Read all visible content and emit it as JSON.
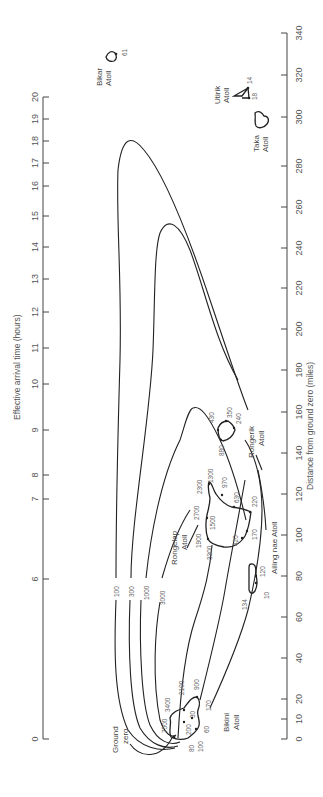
{
  "chart_data": {
    "type": "map",
    "title": "",
    "orientation": "rotated 90deg counter-clockwise",
    "left_axis": {
      "label": "Effective arrival time (hours)",
      "ticks": [
        "0",
        "6",
        "7",
        "8",
        "9",
        "10",
        "11",
        "12",
        "13",
        "14",
        "15",
        "16",
        "17",
        "18",
        "19",
        "20"
      ],
      "scale": "non-linear"
    },
    "right_axis": {
      "label": "Distance from ground zero (miles)",
      "ticks": [
        "0",
        "10",
        "20",
        "40",
        "60",
        "80",
        "100",
        "120",
        "140",
        "160",
        "180",
        "200",
        "220",
        "240",
        "260",
        "280",
        "300",
        "320",
        "340"
      ],
      "range": [
        0,
        340
      ]
    },
    "contours": [
      {
        "label": "100",
        "max_distance_miles": 290
      },
      {
        "label": "300",
        "max_distance_miles": 222
      },
      {
        "label": "1000",
        "max_distance_miles": 160
      },
      {
        "label": "3000",
        "max_distance_miles": 105
      }
    ],
    "inner_contour_labels": [
      "7500",
      "3400",
      "2100",
      "900",
      "170"
    ],
    "atolls": [
      {
        "name": "Bikini Atoll",
        "distance_miles": 5,
        "readings": [
          "7500",
          "3400",
          "2100",
          "900",
          "200",
          "30",
          "80",
          "100",
          "60",
          "170"
        ]
      },
      {
        "name": "Ailinginae Atoll",
        "distance_miles": 80,
        "readings": [
          "134",
          "120",
          "10"
        ]
      },
      {
        "name": "Rongelap Atoll",
        "distance_miles": 110,
        "readings": [
          "3300",
          "1900",
          "2700",
          "2300",
          "1300",
          "1500",
          "970",
          "630",
          "420",
          "220",
          "170"
        ]
      },
      {
        "name": "Rongerik Atoll",
        "distance_miles": 150,
        "readings": [
          "430",
          "880",
          "350",
          "240"
        ]
      },
      {
        "name": "Taka Atoll",
        "distance_miles": 295,
        "readings": []
      },
      {
        "name": "Utirik Atoll",
        "distance_miles": 310,
        "readings": [
          "14",
          "18"
        ]
      },
      {
        "name": "Bikar Atoll",
        "distance_miles": 330,
        "readings": [
          "61"
        ]
      }
    ],
    "annotations": [
      "Ground zero"
    ]
  },
  "labels": {
    "left_axis_title": "Effective arrival time (hours)",
    "right_axis_title": "Distance from ground zero (miles)",
    "ground_zero_1": "Ground",
    "ground_zero_2": "zero",
    "c100": "100",
    "c300": "300",
    "c1000": "1000",
    "c3000": "3000",
    "bikini_1": "Bikini",
    "bikini_2": "Atoll",
    "ailinginae": "Ailing nae Atoll",
    "rongelap_1": "Rongelap",
    "rongelap_2": "Atoll",
    "rongerik_1": "Rongerik",
    "rongerik_2": "Atoll",
    "taka_1": "Taka",
    "taka_2": "Atoll",
    "utirik_1": "Utirik",
    "utirik_2": "Atoll",
    "bikar_1": "Bikar",
    "bikar_2": "Atoll",
    "b7500": "7500",
    "b3400": "3400",
    "b2100": "2100",
    "b900": "900",
    "b200": "200",
    "b30": "30",
    "b80": "80",
    "b100": "100",
    "b60": "60",
    "b170": "170",
    "a134": "134",
    "a120": "120",
    "a10": "10",
    "r3300": "3300",
    "r1900": "1900",
    "r2700": "2700",
    "r2300": "2300",
    "r1300": "1300",
    "r1500": "1500",
    "r970": "970",
    "r630": "630",
    "r420": "420",
    "r220": "220",
    "r170": "170",
    "k430": "430",
    "k880": "880",
    "k350": "350",
    "k240": "240",
    "u14": "14",
    "u18": "18",
    "bk61": "61"
  },
  "left_ticks": [
    {
      "v": "0",
      "y": 739
    },
    {
      "v": "6",
      "y": 579
    },
    {
      "v": "7",
      "y": 499
    },
    {
      "v": "8",
      "y": 475
    },
    {
      "v": "9",
      "y": 430
    },
    {
      "v": "10",
      "y": 384
    },
    {
      "v": "11",
      "y": 348
    },
    {
      "v": "12",
      "y": 312
    },
    {
      "v": "13",
      "y": 279
    },
    {
      "v": "14",
      "y": 247
    },
    {
      "v": "15",
      "y": 216
    },
    {
      "v": "16",
      "y": 186
    },
    {
      "v": "17",
      "y": 163
    },
    {
      "v": "18",
      "y": 141
    },
    {
      "v": "19",
      "y": 119
    },
    {
      "v": "20",
      "y": 97
    }
  ],
  "right_ticks": [
    {
      "v": "0",
      "y": 739
    },
    {
      "v": "10",
      "y": 719
    },
    {
      "v": "20",
      "y": 699
    },
    {
      "v": "40",
      "y": 658
    },
    {
      "v": "60",
      "y": 617
    },
    {
      "v": "80",
      "y": 576
    },
    {
      "v": "100",
      "y": 535
    },
    {
      "v": "120",
      "y": 494
    },
    {
      "v": "140",
      "y": 453
    },
    {
      "v": "160",
      "y": 412
    },
    {
      "v": "180",
      "y": 370
    },
    {
      "v": "200",
      "y": 329
    },
    {
      "v": "220",
      "y": 288
    },
    {
      "v": "240",
      "y": 248
    },
    {
      "v": "260",
      "y": 207
    },
    {
      "v": "280",
      "y": 166
    },
    {
      "v": "300",
      "y": 117
    },
    {
      "v": "320",
      "y": 75
    },
    {
      "v": "340",
      "y": 33
    }
  ]
}
